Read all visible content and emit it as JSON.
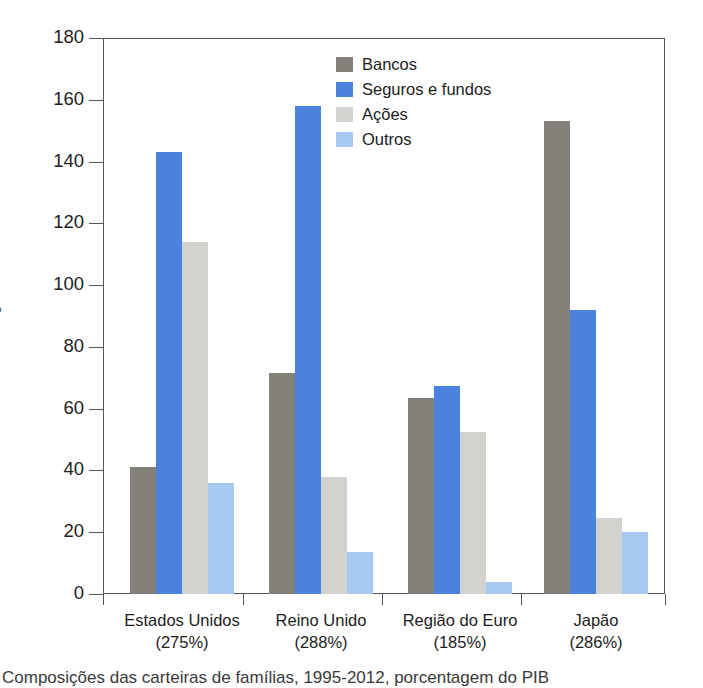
{
  "figure": {
    "caption": "Composições das carteiras de famílias, 1995-2012, porcentagem do PIB"
  },
  "chart_data": {
    "type": "bar",
    "title": "",
    "xlabel": "",
    "ylabel": "Porcentagem",
    "ylim": [
      0,
      180
    ],
    "yticks": [
      0,
      20,
      40,
      60,
      80,
      100,
      120,
      140,
      160,
      180
    ],
    "ytick_labels": [
      "0",
      "20",
      "40",
      "60",
      "80",
      "100",
      "120",
      "140",
      "160",
      "180"
    ],
    "grid": false,
    "legend_position": "inside-top-center",
    "categories": [
      "Estados Unidos",
      "Reino Unido",
      "Região do Euro",
      "Japão"
    ],
    "category_sublabels": [
      "(275%)",
      "(288%)",
      "(185%)",
      "(286%)"
    ],
    "series": [
      {
        "name": "Bancos",
        "color": "#83817a",
        "values": [
          41,
          71.5,
          63.5,
          153
        ]
      },
      {
        "name": "Seguros e fundos",
        "color": "#4b82dd",
        "values": [
          143,
          158,
          67.5,
          92
        ]
      },
      {
        "name": "Ações",
        "color": "#d2d2ce",
        "values": [
          114,
          38,
          52.5,
          24.5
        ]
      },
      {
        "name": "Outros",
        "color": "#a8c9ef",
        "values": [
          36,
          13.5,
          4,
          20
        ]
      }
    ]
  },
  "legend": {
    "items": [
      {
        "label": "Bancos"
      },
      {
        "label": "Seguros e fundos"
      },
      {
        "label": "Ações"
      },
      {
        "label": "Outros"
      }
    ]
  },
  "axis": {
    "y_title": "Porcentagem"
  }
}
